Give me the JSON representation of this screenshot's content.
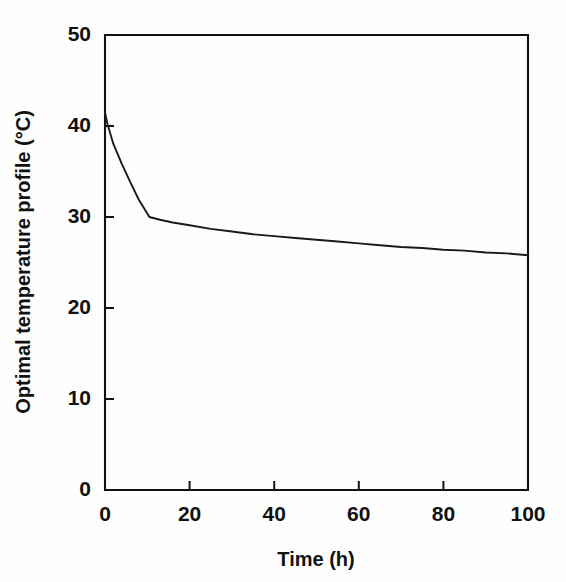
{
  "chart_data": {
    "type": "line",
    "title": "",
    "xlabel": "Time (h)",
    "ylabel": "Optimal temperature profile (°C)",
    "xlim": [
      0,
      100
    ],
    "ylim": [
      0,
      50
    ],
    "xticks": [
      0,
      20,
      40,
      60,
      80,
      100
    ],
    "yticks": [
      0,
      10,
      20,
      30,
      40,
      50
    ],
    "xtick_labels": [
      "0",
      "20",
      "40",
      "60",
      "80",
      "100"
    ],
    "ytick_labels": [
      "0",
      "10",
      "20",
      "30",
      "40",
      "50"
    ],
    "grid": false,
    "legend": false,
    "legend_position": "none",
    "line_color": "#1a1a1a",
    "series": [
      {
        "name": "Optimal temperature profile",
        "x": [
          0,
          0.6,
          2,
          4,
          6,
          8,
          10.5,
          13,
          16,
          20,
          25,
          30,
          35,
          40,
          45,
          50,
          55,
          60,
          65,
          70,
          75,
          80,
          85,
          90,
          95,
          100
        ],
        "values": [
          41.5,
          40.2,
          38.0,
          35.8,
          33.8,
          31.9,
          30.0,
          29.7,
          29.4,
          29.1,
          28.7,
          28.4,
          28.1,
          27.9,
          27.7,
          27.5,
          27.3,
          27.1,
          26.9,
          26.7,
          26.6,
          26.4,
          26.3,
          26.1,
          26.0,
          25.8
        ]
      }
    ],
    "annotations": [
      "Sharp initial decline from about 41.5 °C at t = 0 to 30 °C at t ≈ 10 h",
      "Slow monotonic decay from 30 °C to about 25.8 °C between t = 10 h and t = 100 h"
    ]
  },
  "geometry": {
    "plot_left": 105,
    "plot_right": 528,
    "plot_top": 35,
    "plot_bottom": 490
  }
}
